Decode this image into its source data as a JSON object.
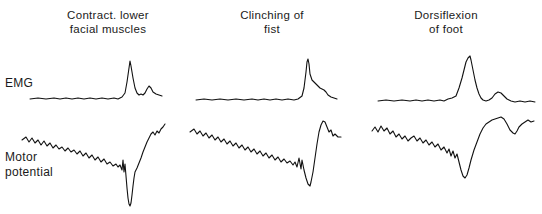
{
  "figure": {
    "type": "physiological-recording",
    "background_color": "#ffffff",
    "trace_color": "#111111"
  },
  "columns": [
    {
      "id": "col-1",
      "title": "Contract. lower\nfacial muscles"
    },
    {
      "id": "col-2",
      "title": "Clinching of\nfist"
    },
    {
      "id": "col-3",
      "title": "Dorsiflexion\nof foot"
    }
  ],
  "rows": [
    {
      "id": "row-emg",
      "label": "EMG"
    },
    {
      "id": "row-motor",
      "label": "Motor\npotential"
    }
  ],
  "chart_data": {
    "type": "line",
    "title": "",
    "xlabel": "",
    "ylabel": "",
    "grid": false,
    "legend": "none",
    "panels": [
      {
        "column": "Contract. lower facial muscles",
        "row": "EMG",
        "x_range": [
          30,
          165
        ],
        "y_range_px": [
          58,
          102
        ],
        "baseline_y": 98,
        "peak_x": 130,
        "peak_y": 62,
        "secondary_bump_x": 150,
        "secondary_bump_y": 87,
        "points": [
          [
            30,
            99
          ],
          [
            38,
            98
          ],
          [
            46,
            99
          ],
          [
            54,
            98
          ],
          [
            60,
            99
          ],
          [
            66,
            98
          ],
          [
            72,
            99
          ],
          [
            78,
            98
          ],
          [
            84,
            99
          ],
          [
            90,
            98
          ],
          [
            96,
            99
          ],
          [
            102,
            98
          ],
          [
            108,
            99
          ],
          [
            114,
            98
          ],
          [
            118,
            99
          ],
          [
            122,
            97
          ],
          [
            125,
            93
          ],
          [
            127,
            82
          ],
          [
            129,
            68
          ],
          [
            130,
            61
          ],
          [
            131,
            66
          ],
          [
            133,
            78
          ],
          [
            135,
            88
          ],
          [
            137,
            93
          ],
          [
            139,
            95
          ],
          [
            141,
            94
          ],
          [
            143,
            95
          ],
          [
            145,
            93
          ],
          [
            147,
            89
          ],
          [
            149,
            86
          ],
          [
            151,
            88
          ],
          [
            153,
            92
          ],
          [
            156,
            94
          ],
          [
            159,
            95
          ],
          [
            162,
            96
          ]
        ]
      },
      {
        "column": "Contract. lower facial muscles",
        "row": "Motor potential",
        "x_range": [
          22,
          168
        ],
        "y_range_px": [
          122,
          208
        ],
        "start_y": 140,
        "trough_x": 130,
        "trough_y": 206,
        "end_y": 124,
        "points": [
          [
            22,
            140
          ],
          [
            26,
            137
          ],
          [
            29,
            142
          ],
          [
            32,
            138
          ],
          [
            35,
            143
          ],
          [
            38,
            140
          ],
          [
            41,
            145
          ],
          [
            44,
            141
          ],
          [
            47,
            146
          ],
          [
            50,
            143
          ],
          [
            53,
            148
          ],
          [
            56,
            145
          ],
          [
            59,
            149
          ],
          [
            62,
            147
          ],
          [
            65,
            151
          ],
          [
            68,
            148
          ],
          [
            71,
            152
          ],
          [
            74,
            150
          ],
          [
            77,
            154
          ],
          [
            80,
            151
          ],
          [
            83,
            156
          ],
          [
            86,
            153
          ],
          [
            89,
            158
          ],
          [
            92,
            155
          ],
          [
            95,
            160
          ],
          [
            98,
            157
          ],
          [
            101,
            162
          ],
          [
            104,
            159
          ],
          [
            107,
            164
          ],
          [
            110,
            162
          ],
          [
            113,
            166
          ],
          [
            116,
            164
          ],
          [
            118,
            167
          ],
          [
            120,
            165
          ],
          [
            122,
            170
          ],
          [
            123,
            160
          ],
          [
            124,
            172
          ],
          [
            125,
            164
          ],
          [
            126,
            176
          ],
          [
            127,
            188
          ],
          [
            128,
            198
          ],
          [
            129,
            204
          ],
          [
            130,
            206
          ],
          [
            131,
            203
          ],
          [
            132,
            195
          ],
          [
            133,
            186
          ],
          [
            134,
            178
          ],
          [
            135,
            172
          ],
          [
            137,
            168
          ],
          [
            139,
            163
          ],
          [
            141,
            158
          ],
          [
            143,
            152
          ],
          [
            145,
            147
          ],
          [
            147,
            142
          ],
          [
            149,
            138
          ],
          [
            151,
            134
          ],
          [
            153,
            132
          ],
          [
            155,
            135
          ],
          [
            157,
            131
          ],
          [
            159,
            133
          ],
          [
            161,
            129
          ],
          [
            163,
            127
          ],
          [
            165,
            124
          ]
        ]
      },
      {
        "column": "Clinching of fist",
        "row": "EMG",
        "x_range": [
          196,
          340
        ],
        "y_range_px": [
          58,
          102
        ],
        "baseline_y": 99,
        "peak_x": 308,
        "peak_y": 60,
        "points": [
          [
            196,
            100
          ],
          [
            204,
            99
          ],
          [
            212,
            100
          ],
          [
            220,
            99
          ],
          [
            228,
            100
          ],
          [
            236,
            99
          ],
          [
            244,
            100
          ],
          [
            252,
            99
          ],
          [
            258,
            100
          ],
          [
            264,
            99
          ],
          [
            270,
            100
          ],
          [
            276,
            99
          ],
          [
            282,
            100
          ],
          [
            288,
            99
          ],
          [
            294,
            100
          ],
          [
            298,
            99
          ],
          [
            302,
            96
          ],
          [
            304,
            88
          ],
          [
            306,
            72
          ],
          [
            307,
            62
          ],
          [
            308,
            59
          ],
          [
            309,
            64
          ],
          [
            310,
            74
          ],
          [
            312,
            80
          ],
          [
            314,
            82
          ],
          [
            316,
            84
          ],
          [
            318,
            86
          ],
          [
            320,
            88
          ],
          [
            322,
            89
          ],
          [
            324,
            90
          ],
          [
            326,
            92
          ],
          [
            328,
            95
          ],
          [
            331,
            97
          ],
          [
            334,
            98
          ],
          [
            337,
            99
          ]
        ]
      },
      {
        "column": "Clinching of fist",
        "row": "Motor potential",
        "x_range": [
          190,
          342
        ],
        "y_range_px": [
          118,
          190
        ],
        "start_y": 132,
        "trough_x": 310,
        "trough_y": 186,
        "peak_after_x": 324,
        "peak_after_y": 121,
        "end_y": 138,
        "points": [
          [
            190,
            132
          ],
          [
            194,
            129
          ],
          [
            197,
            134
          ],
          [
            200,
            131
          ],
          [
            203,
            136
          ],
          [
            206,
            133
          ],
          [
            209,
            138
          ],
          [
            212,
            135
          ],
          [
            215,
            140
          ],
          [
            218,
            137
          ],
          [
            221,
            142
          ],
          [
            224,
            139
          ],
          [
            227,
            144
          ],
          [
            230,
            141
          ],
          [
            233,
            146
          ],
          [
            236,
            143
          ],
          [
            239,
            148
          ],
          [
            242,
            145
          ],
          [
            245,
            150
          ],
          [
            248,
            147
          ],
          [
            251,
            152
          ],
          [
            254,
            149
          ],
          [
            257,
            154
          ],
          [
            260,
            151
          ],
          [
            263,
            156
          ],
          [
            266,
            153
          ],
          [
            269,
            158
          ],
          [
            272,
            155
          ],
          [
            275,
            160
          ],
          [
            278,
            157
          ],
          [
            281,
            162
          ],
          [
            284,
            159
          ],
          [
            287,
            163
          ],
          [
            290,
            161
          ],
          [
            293,
            165
          ],
          [
            295,
            162
          ],
          [
            297,
            167
          ],
          [
            299,
            158
          ],
          [
            301,
            169
          ],
          [
            302,
            160
          ],
          [
            304,
            170
          ],
          [
            306,
            178
          ],
          [
            308,
            184
          ],
          [
            310,
            186
          ],
          [
            311,
            182
          ],
          [
            313,
            172
          ],
          [
            315,
            158
          ],
          [
            317,
            144
          ],
          [
            319,
            132
          ],
          [
            321,
            125
          ],
          [
            323,
            121
          ],
          [
            325,
            122
          ],
          [
            327,
            127
          ],
          [
            329,
            132
          ],
          [
            331,
            130
          ],
          [
            333,
            136
          ],
          [
            335,
            134
          ],
          [
            338,
            137
          ],
          [
            341,
            137
          ]
        ]
      },
      {
        "column": "Dorsiflexion of foot",
        "row": "EMG",
        "x_range": [
          378,
          538
        ],
        "y_range_px": [
          56,
          104
        ],
        "baseline_y": 100,
        "peak_x": 470,
        "peak_y": 57,
        "secondary_bump_x": 500,
        "secondary_bump_y": 92,
        "points": [
          [
            378,
            101
          ],
          [
            386,
            100
          ],
          [
            394,
            101
          ],
          [
            402,
            100
          ],
          [
            410,
            101
          ],
          [
            416,
            100
          ],
          [
            422,
            101
          ],
          [
            428,
            100
          ],
          [
            434,
            101
          ],
          [
            440,
            100
          ],
          [
            444,
            101
          ],
          [
            448,
            99
          ],
          [
            452,
            98
          ],
          [
            456,
            96
          ],
          [
            459,
            88
          ],
          [
            462,
            78
          ],
          [
            464,
            70
          ],
          [
            466,
            62
          ],
          [
            468,
            58
          ],
          [
            470,
            56
          ],
          [
            471,
            60
          ],
          [
            473,
            70
          ],
          [
            475,
            80
          ],
          [
            477,
            88
          ],
          [
            479,
            94
          ],
          [
            481,
            98
          ],
          [
            483,
            100
          ],
          [
            486,
            101
          ],
          [
            489,
            100
          ],
          [
            492,
            98
          ],
          [
            495,
            94
          ],
          [
            498,
            92
          ],
          [
            501,
            93
          ],
          [
            504,
            96
          ],
          [
            507,
            99
          ],
          [
            511,
            101
          ],
          [
            515,
            102
          ],
          [
            520,
            101
          ],
          [
            525,
            102
          ],
          [
            530,
            101
          ],
          [
            535,
            102
          ]
        ]
      },
      {
        "column": "Dorsiflexion of foot",
        "row": "Motor potential",
        "x_range": [
          372,
          538
        ],
        "y_range_px": [
          116,
          182
        ],
        "start_y": 130,
        "trough_x": 464,
        "trough_y": 178,
        "peak_after_x": 502,
        "peak_after_y": 117,
        "dip_x": 516,
        "dip_y": 133,
        "end_y": 122,
        "points": [
          [
            372,
            131
          ],
          [
            375,
            127
          ],
          [
            378,
            132
          ],
          [
            381,
            126
          ],
          [
            384,
            131
          ],
          [
            387,
            128
          ],
          [
            390,
            134
          ],
          [
            393,
            131
          ],
          [
            396,
            137
          ],
          [
            399,
            134
          ],
          [
            402,
            139
          ],
          [
            405,
            136
          ],
          [
            408,
            141
          ],
          [
            411,
            138
          ],
          [
            414,
            136
          ],
          [
            417,
            141
          ],
          [
            420,
            138
          ],
          [
            423,
            143
          ],
          [
            426,
            140
          ],
          [
            429,
            145
          ],
          [
            432,
            142
          ],
          [
            435,
            147
          ],
          [
            438,
            144
          ],
          [
            441,
            150
          ],
          [
            444,
            147
          ],
          [
            447,
            153
          ],
          [
            449,
            149
          ],
          [
            451,
            156
          ],
          [
            453,
            151
          ],
          [
            455,
            158
          ],
          [
            457,
            154
          ],
          [
            459,
            162
          ],
          [
            461,
            170
          ],
          [
            463,
            176
          ],
          [
            465,
            178
          ],
          [
            467,
            175
          ],
          [
            469,
            168
          ],
          [
            471,
            160
          ],
          [
            474,
            150
          ],
          [
            477,
            142
          ],
          [
            480,
            134
          ],
          [
            483,
            128
          ],
          [
            486,
            124
          ],
          [
            489,
            122
          ],
          [
            492,
            120
          ],
          [
            495,
            119
          ],
          [
            498,
            118
          ],
          [
            501,
            117
          ],
          [
            504,
            119
          ],
          [
            507,
            124
          ],
          [
            510,
            130
          ],
          [
            513,
            133
          ],
          [
            515,
            134
          ],
          [
            517,
            131
          ],
          [
            519,
            127
          ],
          [
            522,
            124
          ],
          [
            525,
            122
          ],
          [
            528,
            120
          ],
          [
            531,
            122
          ],
          [
            534,
            121
          ]
        ]
      }
    ]
  }
}
